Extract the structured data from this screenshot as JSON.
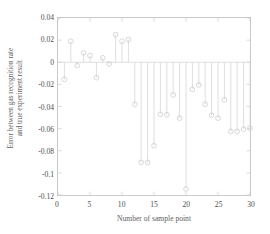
{
  "chart_data": {
    "type": "line",
    "plot_style": "stem",
    "title": "",
    "xlabel": "Number of sample point",
    "ylabel": "Error between gas recognition rate and true experiment result",
    "ylabel_line1": "Error between gas recognition rate",
    "ylabel_line2": "and true experiment result",
    "xlim": [
      0,
      30
    ],
    "ylim": [
      -0.12,
      0.04
    ],
    "xticks": [
      0,
      5,
      10,
      15,
      20,
      25,
      30
    ],
    "xtick_labels": [
      "0",
      "5",
      "10",
      "15",
      "20",
      "25",
      "30"
    ],
    "yticks": [
      0.04,
      0.02,
      0,
      -0.02,
      -0.04,
      -0.06,
      -0.08,
      -0.1,
      -0.12
    ],
    "ytick_labels": [
      "0.04",
      "0.02",
      "0",
      "-0.02",
      "-0.04",
      "-0.06",
      "-0.08",
      "-0.1",
      "-0.12"
    ],
    "grid": false,
    "legend": null,
    "baseline": 0,
    "marker": "circle-open",
    "line_color": "#d5d5d5",
    "marker_color": "#cfcfcf",
    "axis_color": "#c9c9c9",
    "x": [
      1,
      2,
      3,
      4,
      5,
      6,
      7,
      8,
      9,
      10,
      11,
      12,
      13,
      14,
      15,
      16,
      17,
      18,
      19,
      20,
      21,
      22,
      23,
      24,
      25,
      26,
      27,
      28,
      29,
      30
    ],
    "values": [
      -0.0155,
      0.019,
      -0.003,
      0.0085,
      0.006,
      -0.014,
      0.004,
      -0.0015,
      0.025,
      0.019,
      0.0205,
      -0.038,
      -0.0905,
      -0.0905,
      -0.0755,
      -0.047,
      -0.0475,
      -0.0295,
      -0.0505,
      -0.1145,
      -0.0245,
      -0.0205,
      -0.038,
      -0.048,
      -0.0505,
      -0.034,
      -0.0625,
      -0.0625,
      -0.0605,
      -0.0595
    ]
  }
}
